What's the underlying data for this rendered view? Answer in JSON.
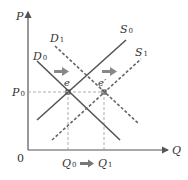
{
  "diagram": {
    "type": "supply-demand",
    "axes": {
      "y_label": "P",
      "x_label": "Q",
      "origin_label": "0"
    },
    "curves": [
      {
        "id": "D0",
        "label": "D",
        "sub": "0",
        "style": "solid"
      },
      {
        "id": "D1",
        "label": "D",
        "sub": "1",
        "style": "dashed"
      },
      {
        "id": "S0",
        "label": "S",
        "sub": "0",
        "style": "solid"
      },
      {
        "id": "S1",
        "label": "S",
        "sub": "1",
        "style": "dashed"
      }
    ],
    "points": [
      {
        "id": "e",
        "label": "e"
      },
      {
        "id": "e_prime",
        "label": "e′"
      }
    ],
    "price_label": {
      "label": "P",
      "sub": "0"
    },
    "quantity_labels": [
      {
        "label": "Q",
        "sub": "0"
      },
      {
        "label": "Q",
        "sub": "1"
      }
    ],
    "arrows": [
      "demand-shift-right",
      "supply-shift-right",
      "quantity-shift-right"
    ],
    "colors": {
      "line": "#555555",
      "guide": "#999999",
      "arrow": "#888888",
      "text": "#333333"
    }
  }
}
